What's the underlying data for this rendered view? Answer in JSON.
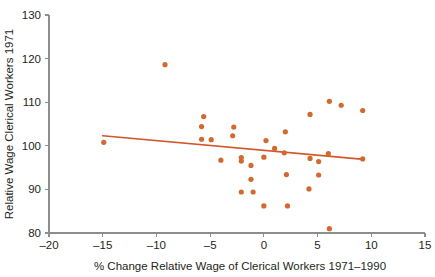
{
  "chart_data": {
    "type": "scatter",
    "title": "",
    "xlabel": "% Change Relative Wage of Clerical Workers 1971–1990",
    "ylabel": "Relative Wage Clerical Workers 1971",
    "xlim": [
      -20,
      15
    ],
    "ylim": [
      80,
      130
    ],
    "xticks": [
      -20,
      -15,
      -10,
      -5,
      0,
      5,
      10,
      15
    ],
    "xtick_labels": [
      "–20",
      "–15",
      "–10",
      "–5",
      "0",
      "5",
      "10",
      "15"
    ],
    "yticks": [
      80,
      90,
      100,
      110,
      120,
      130
    ],
    "ytick_labels": [
      "80",
      "90",
      "100",
      "110",
      "120",
      "130"
    ],
    "grid": false,
    "legend": null,
    "point_color": "#d2692f",
    "trend_color": "#d2562a",
    "axis_color": "#8d8d8d",
    "marker_radius": 2.6,
    "points": [
      {
        "x": -14.9,
        "y": 100.8
      },
      {
        "x": -9.2,
        "y": 118.6
      },
      {
        "x": -5.6,
        "y": 106.7
      },
      {
        "x": -5.8,
        "y": 104.4
      },
      {
        "x": -5.8,
        "y": 101.5
      },
      {
        "x": -4.9,
        "y": 101.4
      },
      {
        "x": -4.0,
        "y": 96.7
      },
      {
        "x": -2.8,
        "y": 104.3
      },
      {
        "x": -2.9,
        "y": 102.3
      },
      {
        "x": -2.1,
        "y": 97.3
      },
      {
        "x": -2.1,
        "y": 96.5
      },
      {
        "x": -2.1,
        "y": 89.4
      },
      {
        "x": -1.2,
        "y": 95.5
      },
      {
        "x": -1.2,
        "y": 92.3
      },
      {
        "x": -1.0,
        "y": 89.4
      },
      {
        "x": 0.2,
        "y": 101.2
      },
      {
        "x": 0.0,
        "y": 97.4
      },
      {
        "x": 0.0,
        "y": 86.2
      },
      {
        "x": 1.0,
        "y": 99.4
      },
      {
        "x": 2.0,
        "y": 103.2
      },
      {
        "x": 1.9,
        "y": 98.4
      },
      {
        "x": 2.1,
        "y": 93.4
      },
      {
        "x": 2.2,
        "y": 86.2
      },
      {
        "x": 4.3,
        "y": 107.2
      },
      {
        "x": 4.3,
        "y": 97.1
      },
      {
        "x": 4.2,
        "y": 90.1
      },
      {
        "x": 5.1,
        "y": 96.4
      },
      {
        "x": 5.1,
        "y": 93.3
      },
      {
        "x": 6.1,
        "y": 110.2
      },
      {
        "x": 6.0,
        "y": 98.2
      },
      {
        "x": 6.1,
        "y": 81.0
      },
      {
        "x": 7.2,
        "y": 109.3
      },
      {
        "x": 9.2,
        "y": 108.1
      },
      {
        "x": 9.2,
        "y": 97.0
      }
    ],
    "trend_line": {
      "x0": -15.0,
      "y0": 102.3,
      "x1": 9.3,
      "y1": 96.9
    }
  }
}
